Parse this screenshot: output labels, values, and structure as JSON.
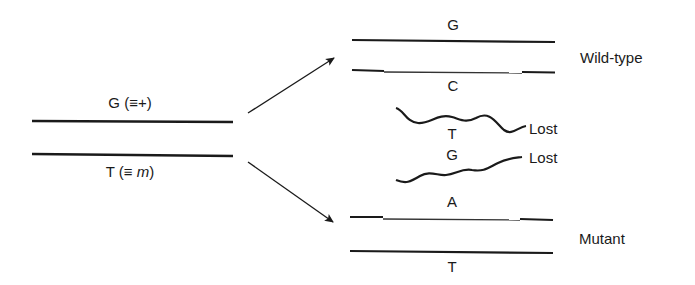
{
  "parent_duplex": {
    "top_strand": {
      "base": "G",
      "equiv_open": " (≡",
      "equiv_symbol": "+",
      "equiv_close": ")"
    },
    "bottom_strand": {
      "base": "T",
      "equiv_open": " (≡ ",
      "equiv_symbol": "m",
      "equiv_close": ")"
    }
  },
  "wild_type": {
    "label": "Wild-type",
    "top_strand_base": "G",
    "bottom_strand_base": "C"
  },
  "lost_strands": [
    {
      "base": "T",
      "label": "Lost"
    },
    {
      "base": "G",
      "label": "Lost"
    }
  ],
  "mutant": {
    "label": "Mutant",
    "top_strand_base": "A",
    "bottom_strand_base": "T"
  },
  "colors": {
    "line": "#1a1a1a",
    "background": "#ffffff"
  }
}
